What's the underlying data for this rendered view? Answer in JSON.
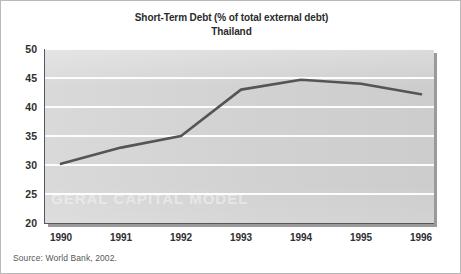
{
  "figure": {
    "width": 461,
    "height": 274,
    "background_color": "#ffffff",
    "border_color": "#b9b9b9"
  },
  "title": {
    "main": "Short-Term Debt (% of total external debt)",
    "sub": "Thailand"
  },
  "source_note": "Source: World Bank, 2002.",
  "watermark": "GERAL CAPITAL MODEL",
  "style": {
    "plot_background": "#d5d5d5",
    "gridline_color": "#fdfdfd",
    "axis_color": "#56565e",
    "series_color": "#555558",
    "text_color": "#2f2f2f",
    "shadow_color": "#9a9a9a"
  },
  "chart_data": {
    "type": "line",
    "subtitle": "Thailand",
    "xlabel": "",
    "ylabel": "",
    "x": [
      1990,
      1991,
      1992,
      1993,
      1994,
      1995,
      1996
    ],
    "categories": [
      "1990",
      "1991",
      "1992",
      "1993",
      "1994",
      "1995",
      "1996"
    ],
    "values": [
      30.2,
      33.0,
      35.0,
      43.0,
      44.7,
      44.0,
      42.2
    ],
    "series": [
      {
        "name": "Short-term debt (% of total external debt)",
        "color": "#555558",
        "values": [
          30.2,
          33.0,
          35.0,
          43.0,
          44.7,
          44.0,
          42.2
        ]
      }
    ],
    "ylim": [
      20,
      50
    ],
    "yticks": [
      20,
      25,
      30,
      35,
      40,
      45,
      50
    ],
    "ytick_labels": [
      "20",
      "25",
      "30",
      "35",
      "40",
      "45",
      "50"
    ],
    "xlim": [
      1990,
      1996
    ],
    "xtick_labels": [
      "1990",
      "1991",
      "1992",
      "1993",
      "1994",
      "1995",
      "1996"
    ],
    "grid": "horizontal",
    "legend": "none",
    "source": "World Bank, 2002"
  }
}
